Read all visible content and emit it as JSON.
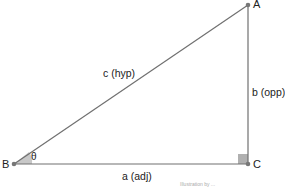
{
  "diagram": {
    "vertices": {
      "A": {
        "label": "A",
        "x": 248,
        "y": 5
      },
      "B": {
        "label": "B",
        "x": 14,
        "y": 164
      },
      "C": {
        "label": "C",
        "x": 248,
        "y": 164
      }
    },
    "sides": {
      "hypotenuse": "c (hyp)",
      "opposite": "b (opp)",
      "adjacent": "a (adj)"
    },
    "angle_label": "θ",
    "caption": "Illustration by ...",
    "colors": {
      "line": "#707070",
      "vertex": "#777777",
      "right_angle_fill": "#b0b0b0",
      "angle_fill": "#c8c8c8",
      "text": "#222222"
    }
  }
}
